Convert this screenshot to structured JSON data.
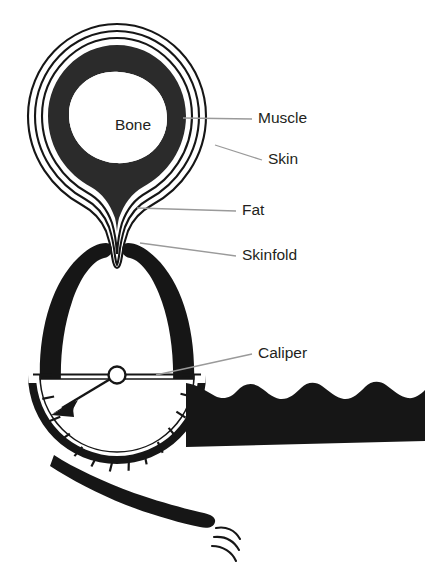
{
  "figure": {
    "background_color": "#ffffff",
    "ink_color": "#161616",
    "muscle_color": "#2b2b2b",
    "text_color": "#231f20",
    "leader_color": "#9a9a9a",
    "canvas": {
      "width": 425,
      "height": 572
    }
  },
  "labels": [
    {
      "id": "muscle",
      "text": "Muscle",
      "text_x": 258,
      "text_y": 119,
      "leader_from_x": 183,
      "leader_from_y": 118,
      "leader_to_x": 252,
      "leader_to_y": 119
    },
    {
      "id": "skin",
      "text": "Skin",
      "text_x": 268,
      "text_y": 159,
      "leader_from_x": 215,
      "leader_from_y": 145,
      "leader_to_x": 262,
      "leader_to_y": 160
    },
    {
      "id": "fat",
      "text": "Fat",
      "text_x": 242,
      "text_y": 211,
      "leader_from_x": 137,
      "leader_from_y": 208,
      "leader_to_x": 236,
      "leader_to_y": 211
    },
    {
      "id": "skinfold",
      "text": "Skinfold",
      "text_x": 242,
      "text_y": 256,
      "leader_from_x": 140,
      "leader_from_y": 243,
      "leader_to_x": 236,
      "leader_to_y": 256
    },
    {
      "id": "caliper",
      "text": "Caliper",
      "text_x": 258,
      "text_y": 354,
      "leader_from_x": 156,
      "leader_from_y": 375,
      "leader_to_x": 252,
      "leader_to_y": 354
    }
  ],
  "anatomy": {
    "bone_label": "Bone",
    "bone_label_x": 133,
    "bone_label_y": 126,
    "layers": [
      {
        "name": "skin-outline",
        "kind": "outline-stroke"
      },
      {
        "name": "fat-layer",
        "kind": "white-band"
      },
      {
        "name": "muscle-ring",
        "kind": "dark-ring"
      },
      {
        "name": "bone-core",
        "kind": "white-core"
      }
    ]
  },
  "caliper": {
    "parts": [
      {
        "name": "upper-jaw-arch",
        "kind": "thick-black-arch"
      },
      {
        "name": "dial-face",
        "kind": "semicircle-gauge"
      },
      {
        "name": "dial-rim",
        "kind": "thick-dark-rim"
      },
      {
        "name": "needle",
        "kind": "pointer-arrow"
      },
      {
        "name": "needle-hub",
        "kind": "hollow-circle"
      },
      {
        "name": "handle-grip",
        "kind": "scalloped-bar"
      },
      {
        "name": "lever-arm",
        "kind": "tapered-bar"
      },
      {
        "name": "motion-lines",
        "kind": "three-arcs"
      }
    ],
    "dial": {
      "center_x": 117,
      "center_y": 375,
      "radius": 82,
      "tick_count": 11,
      "needle_angle_deg": 209
    },
    "handle": {
      "scallop_count": 4,
      "start_x": 196,
      "end_x": 425,
      "top_y": 383,
      "bottom_y": 445
    },
    "motion_lines": {
      "count": 3,
      "center_x": 224,
      "center_y": 528
    }
  }
}
